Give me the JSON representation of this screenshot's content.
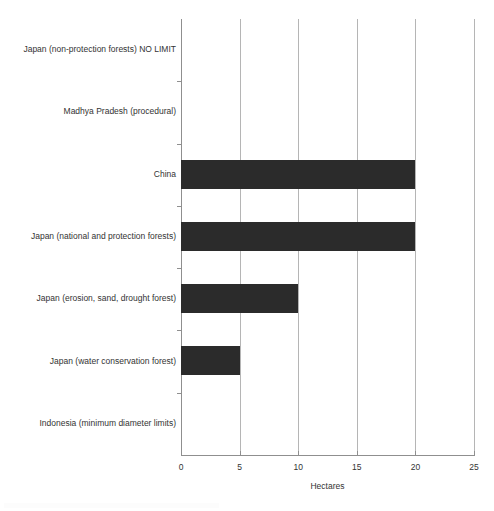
{
  "chart_data": {
    "type": "bar",
    "orientation": "horizontal",
    "title": "",
    "xlabel": "Hectares",
    "ylabel": "",
    "xlim": [
      0,
      25
    ],
    "xticks": [
      0,
      5,
      10,
      15,
      20,
      25
    ],
    "xtick_labels": [
      "0",
      "5",
      "10",
      "15",
      "20",
      "25"
    ],
    "grid": "vertical",
    "legend": "none",
    "bar_color": "#2b2b2b",
    "gridline_color": "#b5b5b5",
    "axis_color": "#8f8f8f",
    "text_color": "#333333",
    "categories": [
      "Japan (non-protection forests) NO LIMIT",
      "Madhya Pradesh (procedural)",
      "China",
      "Japan (national and protection forests)",
      "Japan (erosion, sand, drought forest)",
      "Japan (water conservation forest)",
      "Indonesia (minimum diameter limits)"
    ],
    "values": [
      0,
      0,
      20,
      20,
      10,
      5,
      0
    ]
  }
}
